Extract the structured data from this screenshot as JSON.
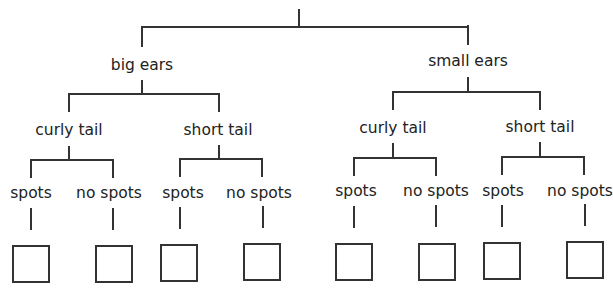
{
  "diagram": {
    "type": "tree-diagram",
    "line_color": "#333333",
    "text_color": "#222222",
    "root": {
      "label_visible": false,
      "note": "title clipped at top edge"
    },
    "level1": [
      {
        "label": "big ears"
      },
      {
        "label": "small ears"
      }
    ],
    "level2": [
      {
        "label": "curly tail"
      },
      {
        "label": "short tail"
      },
      {
        "label": "curly tail"
      },
      {
        "label": "short tail"
      }
    ],
    "level3": [
      {
        "label": "spots"
      },
      {
        "label": "no spots"
      },
      {
        "label": "spots"
      },
      {
        "label": "no spots"
      },
      {
        "label": "spots"
      },
      {
        "label": "no spots"
      },
      {
        "label": "spots"
      },
      {
        "label": "no spots"
      }
    ],
    "answer_boxes": [
      {
        "value": ""
      },
      {
        "value": ""
      },
      {
        "value": ""
      },
      {
        "value": ""
      },
      {
        "value": ""
      },
      {
        "value": ""
      },
      {
        "value": ""
      },
      {
        "value": ""
      }
    ]
  }
}
